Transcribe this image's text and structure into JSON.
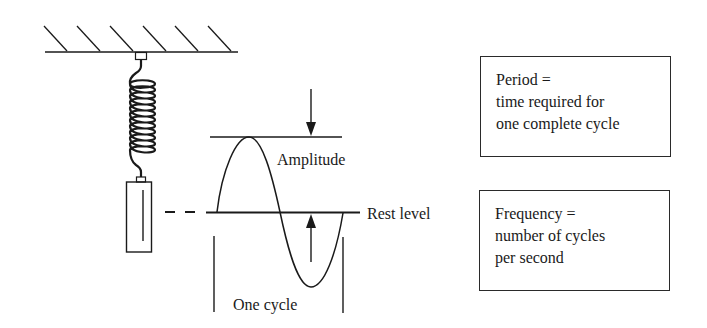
{
  "diagram": {
    "labels": {
      "amplitude": "Amplitude",
      "rest_level": "Rest level",
      "one_cycle": "One cycle"
    },
    "period_box": {
      "lines": [
        "Period =",
        "time required for",
        "one complete cycle"
      ]
    },
    "frequency_box": {
      "lines": [
        "Frequency =",
        "number of cycles",
        "per second"
      ]
    },
    "colors": {
      "ink": "#1a1a1a",
      "background": "#ffffff"
    }
  }
}
